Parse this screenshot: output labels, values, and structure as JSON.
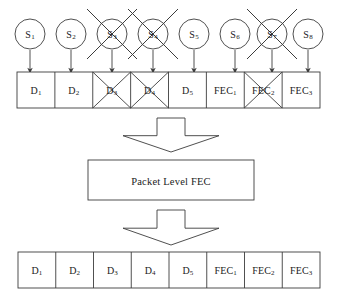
{
  "figure": {
    "type": "block-diagram",
    "stroke_color": "#3c3c3c",
    "background": "#ffffff"
  },
  "sources": {
    "label_prefix": "S",
    "nodes": [
      {
        "id": "S1",
        "base": "S",
        "sub": "1",
        "lost": false,
        "cx": 30,
        "cy": 34
      },
      {
        "id": "S2",
        "base": "S",
        "sub": "2",
        "lost": false,
        "cx": 71,
        "cy": 34
      },
      {
        "id": "S3",
        "base": "S",
        "sub": "3",
        "lost": true,
        "cx": 112,
        "cy": 34
      },
      {
        "id": "S4",
        "base": "S",
        "sub": "4",
        "lost": true,
        "cx": 153,
        "cy": 34
      },
      {
        "id": "S5",
        "base": "S",
        "sub": "5",
        "lost": false,
        "cx": 194,
        "cy": 34
      },
      {
        "id": "S6",
        "base": "S",
        "sub": "6",
        "lost": false,
        "cx": 235,
        "cy": 34
      },
      {
        "id": "S7",
        "base": "S",
        "sub": "7",
        "lost": true,
        "cx": 272,
        "cy": 34
      },
      {
        "id": "S8",
        "base": "S",
        "sub": "8",
        "lost": false,
        "cx": 308,
        "cy": 34
      }
    ],
    "radius": 15
  },
  "received_row": {
    "name": "received-packet-row",
    "x": 17,
    "y": 72,
    "width": 303,
    "height": 36,
    "cells": [
      {
        "id": "D1",
        "base": "D",
        "sub": "1",
        "lost": false
      },
      {
        "id": "D2",
        "base": "D",
        "sub": "2",
        "lost": false
      },
      {
        "id": "D3",
        "base": "D",
        "sub": "3",
        "lost": true
      },
      {
        "id": "D4",
        "base": "D",
        "sub": "4",
        "lost": true
      },
      {
        "id": "D5",
        "base": "D",
        "sub": "5",
        "lost": false
      },
      {
        "id": "FEC1",
        "base": "FEC",
        "sub": "1",
        "lost": false
      },
      {
        "id": "FEC2",
        "base": "FEC",
        "sub": "2",
        "lost": true
      },
      {
        "id": "FEC3",
        "base": "FEC",
        "sub": "3",
        "lost": false
      }
    ]
  },
  "decoder": {
    "name": "packet-level-fec-block",
    "label": "Packet Level FEC",
    "x": 88,
    "y": 160,
    "width": 166,
    "height": 40
  },
  "arrows": {
    "down_block_arrow_1": {
      "cx": 171,
      "top": 118,
      "bottom": 152
    },
    "down_block_arrow_2": {
      "cx": 171,
      "top": 210,
      "bottom": 245
    }
  },
  "recovered_row": {
    "name": "recovered-packet-row",
    "x": 18,
    "y": 252,
    "width": 302,
    "height": 36,
    "cells": [
      {
        "id": "D1",
        "base": "D",
        "sub": "1",
        "lost": false
      },
      {
        "id": "D2",
        "base": "D",
        "sub": "2",
        "lost": false
      },
      {
        "id": "D3",
        "base": "D",
        "sub": "3",
        "lost": false
      },
      {
        "id": "D4",
        "base": "D",
        "sub": "4",
        "lost": false
      },
      {
        "id": "D5",
        "base": "D",
        "sub": "5",
        "lost": false
      },
      {
        "id": "FEC1",
        "base": "FEC",
        "sub": "1",
        "lost": false
      },
      {
        "id": "FEC2",
        "base": "FEC",
        "sub": "2",
        "lost": false
      },
      {
        "id": "FEC3",
        "base": "FEC",
        "sub": "3",
        "lost": false
      }
    ]
  }
}
